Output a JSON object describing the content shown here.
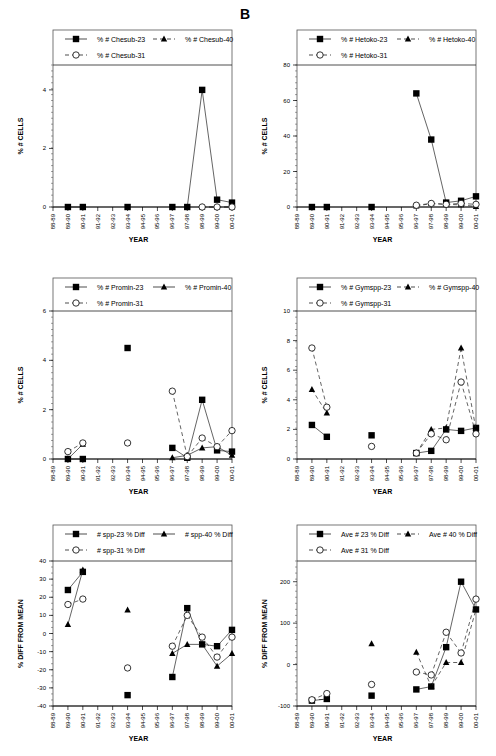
{
  "figure_label": "B",
  "chart_data": [
    {
      "id": "chesub",
      "type": "line",
      "xlabel": "YEAR",
      "ylabel": "% # CELLS",
      "categories": [
        "88-89",
        "89-90",
        "90-91",
        "91-92",
        "92-93",
        "93-94",
        "94-95",
        "95-96",
        "96-97",
        "97-98",
        "98-99",
        "99-00",
        "00-01",
        "01-02"
      ],
      "ylim": [
        0,
        4.85
      ],
      "yticks": [
        0,
        2,
        4
      ],
      "grid": false,
      "legend_position": "top-inside-box",
      "series": [
        {
          "name": "% # Chesub-23",
          "marker": "square",
          "line": "solid",
          "points": [
            [
              1,
              0
            ],
            [
              2,
              0
            ],
            [
              5,
              0
            ],
            [
              8,
              0
            ],
            [
              9,
              0
            ],
            [
              10,
              4.0
            ],
            [
              11,
              0.25
            ],
            [
              12,
              0.15
            ]
          ]
        },
        {
          "name": "% # Chesub-40",
          "marker": "triangle",
          "line": "dashed",
          "points": [
            [
              10,
              0
            ],
            [
              11,
              0
            ],
            [
              12,
              0
            ]
          ]
        },
        {
          "name": "% # Chesub-31",
          "marker": "circle",
          "line": "dashed",
          "points": [
            [
              10,
              0
            ],
            [
              11,
              0
            ],
            [
              12,
              0
            ]
          ]
        }
      ]
    },
    {
      "id": "hetoko",
      "type": "line",
      "xlabel": "YEAR",
      "ylabel": "% # CELLS",
      "categories": [
        "88-89",
        "89-90",
        "90-91",
        "91-92",
        "92-93",
        "93-94",
        "94-95",
        "95-96",
        "96-97",
        "97-98",
        "98-99",
        "99-00",
        "00-01",
        "01-02"
      ],
      "ylim": [
        0,
        80
      ],
      "yticks": [
        0,
        20,
        40,
        60,
        80
      ],
      "grid": false,
      "legend_position": "top-inside-box",
      "series": [
        {
          "name": "% # Hetoko-23",
          "marker": "square",
          "line": "solid",
          "points": [
            [
              1,
              0
            ],
            [
              2,
              0
            ],
            [
              5,
              0
            ],
            [
              8,
              64
            ],
            [
              9,
              38
            ],
            [
              10,
              2.5
            ],
            [
              11,
              3.5
            ],
            [
              12,
              6
            ]
          ]
        },
        {
          "name": "% # Hetoko-40",
          "marker": "triangle",
          "line": "dashed",
          "points": [
            [
              8,
              0.5
            ],
            [
              9,
              2
            ],
            [
              10,
              1.5
            ],
            [
              11,
              1.2
            ],
            [
              12,
              0.3
            ]
          ]
        },
        {
          "name": "% # Hetoko-31",
          "marker": "circle",
          "line": "dashed",
          "points": [
            [
              8,
              1
            ],
            [
              9,
              2
            ],
            [
              10,
              1.5
            ],
            [
              11,
              2
            ],
            [
              12,
              1.5
            ]
          ]
        }
      ]
    },
    {
      "id": "promin",
      "type": "line",
      "xlabel": "YEAR",
      "ylabel": "% # CELLS",
      "categories": [
        "88-89",
        "89-90",
        "90-91",
        "91-92",
        "92-93",
        "93-94",
        "94-95",
        "95-96",
        "96-97",
        "97-98",
        "98-99",
        "99-00",
        "00-01",
        "01-02"
      ],
      "ylim": [
        0,
        6
      ],
      "yticks": [
        0,
        2,
        4,
        6
      ],
      "grid": false,
      "legend_position": "top-inside-box",
      "series": [
        {
          "name": "% # Promin-23",
          "marker": "square",
          "line": "solid",
          "points": [
            [
              1,
              0
            ],
            [
              2,
              0
            ],
            [
              5,
              4.5
            ],
            [
              8,
              0.45
            ],
            [
              9,
              0.05
            ],
            [
              10,
              2.4
            ],
            [
              11,
              0.35
            ],
            [
              12,
              0.3
            ]
          ]
        },
        {
          "name": "% # Promin-40",
          "marker": "triangle",
          "line": "solid",
          "points": [
            [
              1,
              0
            ],
            [
              2,
              0.6
            ],
            [
              8,
              0.05
            ],
            [
              9,
              0.15
            ],
            [
              10,
              0.45
            ],
            [
              11,
              0.5
            ],
            [
              12,
              0.15
            ]
          ]
        },
        {
          "name": "% # Promin-31",
          "marker": "circle",
          "line": "dashed",
          "points": [
            [
              1,
              0.3
            ],
            [
              2,
              0.65
            ],
            [
              5,
              0.65
            ],
            [
              8,
              2.75
            ],
            [
              9,
              0.1
            ],
            [
              10,
              0.85
            ],
            [
              11,
              0.5
            ],
            [
              12,
              1.15
            ]
          ]
        }
      ]
    },
    {
      "id": "gymspp",
      "type": "line",
      "xlabel": "YEAR",
      "ylabel": "% # CELLS",
      "categories": [
        "88-89",
        "89-90",
        "90-91",
        "91-92",
        "92-93",
        "93-94",
        "94-95",
        "95-96",
        "96-97",
        "97-98",
        "98-99",
        "99-00",
        "00-01",
        "01-02"
      ],
      "ylim": [
        0,
        10
      ],
      "yticks": [
        0,
        2,
        4,
        6,
        8,
        10
      ],
      "grid": false,
      "legend_position": "top-inside-box",
      "series": [
        {
          "name": "% # Gymspp-23",
          "marker": "square",
          "line": "solid",
          "points": [
            [
              1,
              2.3
            ],
            [
              2,
              1.5
            ],
            [
              5,
              1.6
            ],
            [
              8,
              0.4
            ],
            [
              9,
              0.55
            ],
            [
              10,
              2.0
            ],
            [
              11,
              1.9
            ],
            [
              12,
              2.1
            ]
          ]
        },
        {
          "name": "% # Gymspp-40",
          "marker": "triangle",
          "line": "dashed",
          "points": [
            [
              1,
              4.7
            ],
            [
              2,
              3.1
            ],
            [
              8,
              0.4
            ],
            [
              9,
              2.0
            ],
            [
              10,
              2.1
            ],
            [
              11,
              7.5
            ],
            [
              12,
              2.0
            ]
          ]
        },
        {
          "name": "% # Gymspp-31",
          "marker": "circle",
          "line": "dashed",
          "points": [
            [
              1,
              7.5
            ],
            [
              2,
              3.5
            ],
            [
              5,
              0.85
            ],
            [
              8,
              0.4
            ],
            [
              9,
              1.7
            ],
            [
              10,
              1.3
            ],
            [
              11,
              5.2
            ],
            [
              12,
              1.7
            ]
          ]
        }
      ]
    },
    {
      "id": "spp-diff",
      "type": "line",
      "xlabel": "YEAR",
      "ylabel": "% DIFF FROM MEAN",
      "categories": [
        "88-89",
        "89-90",
        "90-91",
        "91-92",
        "92-93",
        "93-94",
        "94-95",
        "95-96",
        "96-97",
        "97-98",
        "98-99",
        "99-00",
        "00-01",
        "01-02"
      ],
      "ylim": [
        -40,
        40
      ],
      "yticks": [
        -40,
        -30,
        -20,
        -10,
        0,
        10,
        20,
        30,
        40
      ],
      "grid": false,
      "legend_position": "top-inside-box",
      "series": [
        {
          "name": "# spp-23 % Diff",
          "marker": "square",
          "line": "solid",
          "points": [
            [
              1,
              24
            ],
            [
              2,
              34
            ],
            [
              5,
              -34
            ],
            [
              8,
              -24
            ],
            [
              9,
              14
            ],
            [
              10,
              -6
            ],
            [
              11,
              -7
            ],
            [
              12,
              2
            ]
          ]
        },
        {
          "name": "# spp-40 % Diff",
          "marker": "triangle",
          "line": "solid",
          "points": [
            [
              1,
              5
            ],
            [
              2,
              35
            ],
            [
              5,
              13
            ],
            [
              8,
              -11
            ],
            [
              9,
              -6
            ],
            [
              10,
              -6
            ],
            [
              11,
              -18
            ],
            [
              12,
              -11
            ]
          ]
        },
        {
          "name": "# spp-31 % Diff",
          "marker": "circle",
          "line": "dashed",
          "points": [
            [
              1,
              16
            ],
            [
              2,
              19
            ],
            [
              5,
              -19
            ],
            [
              8,
              -7
            ],
            [
              9,
              10
            ],
            [
              10,
              -2
            ],
            [
              11,
              -13
            ],
            [
              12,
              -2
            ]
          ]
        }
      ]
    },
    {
      "id": "ave-diff",
      "type": "line",
      "xlabel": "YEAR",
      "ylabel": "% DIFF FROM MEAN",
      "categories": [
        "88-89",
        "89-90",
        "90-91",
        "91-92",
        "92-93",
        "93-94",
        "94-95",
        "95-96",
        "96-97",
        "97-98",
        "98-99",
        "99-00",
        "00-01",
        "01-02"
      ],
      "ylim": [
        -100,
        250
      ],
      "yticks": [
        -100,
        0,
        100,
        200
      ],
      "grid": false,
      "legend_position": "top-inside-box",
      "series": [
        {
          "name": "Ave # 23 % Diff",
          "marker": "square",
          "line": "solid",
          "points": [
            [
              1,
              -87
            ],
            [
              2,
              -83
            ],
            [
              5,
              -75
            ],
            [
              8,
              -60
            ],
            [
              9,
              -53
            ],
            [
              10,
              42
            ],
            [
              11,
              200
            ],
            [
              12,
              133
            ]
          ]
        },
        {
          "name": "Ave # 40 % Diff",
          "marker": "triangle",
          "line": "dashed",
          "points": [
            [
              1,
              -85
            ],
            [
              2,
              -84
            ],
            [
              5,
              50
            ],
            [
              8,
              30
            ],
            [
              9,
              -53
            ],
            [
              10,
              5
            ],
            [
              11,
              5
            ],
            [
              12,
              133
            ]
          ]
        },
        {
          "name": "Ave # 31 % Diff",
          "marker": "circle",
          "line": "dashed",
          "points": [
            [
              1,
              -85
            ],
            [
              2,
              -70
            ],
            [
              5,
              -48
            ],
            [
              8,
              -18
            ],
            [
              9,
              -25
            ],
            [
              10,
              78
            ],
            [
              11,
              28
            ],
            [
              12,
              158
            ]
          ]
        }
      ]
    }
  ],
  "panels_layout": [
    {
      "x0": 53,
      "x1": 232,
      "legendTop": 30,
      "plotTop": 65,
      "plotBottom": 207
    },
    {
      "x0": 297,
      "x1": 476,
      "legendTop": 30,
      "plotTop": 65,
      "plotBottom": 207
    },
    {
      "x0": 53,
      "x1": 232,
      "legendTop": 278,
      "plotTop": 311,
      "plotBottom": 459
    },
    {
      "x0": 297,
      "x1": 476,
      "legendTop": 278,
      "plotTop": 311,
      "plotBottom": 459
    },
    {
      "x0": 53,
      "x1": 232,
      "legendTop": 525,
      "plotTop": 561,
      "plotBottom": 706
    },
    {
      "x0": 297,
      "x1": 476,
      "legendTop": 525,
      "plotTop": 561,
      "plotBottom": 706
    }
  ]
}
